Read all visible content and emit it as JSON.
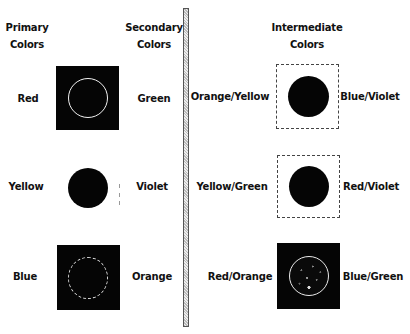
{
  "headers": {
    "primary": [
      "Primary",
      "Colors"
    ],
    "secondary": [
      "Secondary",
      "Colors"
    ],
    "intermediate": [
      "Intermediate",
      "Colors"
    ]
  },
  "left_rows": [
    {
      "primary": "Red",
      "secondary": "Green",
      "swatch": "dark box with white circle outline"
    },
    {
      "primary": "Yellow",
      "secondary": "Violet",
      "swatch": "black filled circle, no box"
    },
    {
      "primary": "Blue",
      "secondary": "Orange",
      "swatch": "dark box with dotted white circle outline"
    }
  ],
  "right_rows": [
    {
      "left": "Orange/Yellow",
      "right": "Blue/Violet",
      "swatch": "light box with black filled circle"
    },
    {
      "left": "Yellow/Green",
      "right": "Red/Violet",
      "swatch": "light box with black filled circle"
    },
    {
      "left": "Red/Orange",
      "right": "Blue/Green",
      "swatch": "dark box with speckled white circle"
    }
  ],
  "colors": {
    "background": "#ffffff",
    "swatch_dark": "#050505",
    "circle_outline": "#f2f2f2",
    "text": "#111111"
  }
}
